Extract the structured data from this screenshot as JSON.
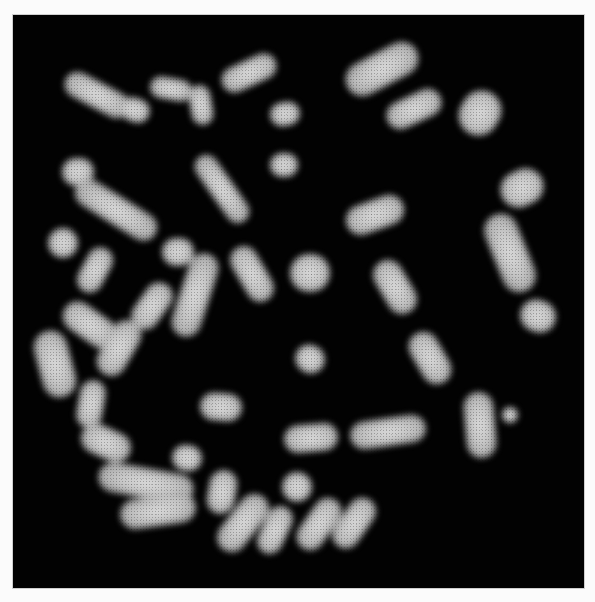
{
  "image": {
    "description": "Fluorescence micrograph of a metaphase chromosome spread on black background",
    "background_color": "#020202",
    "frame_color": "#fbfbfb",
    "chromosome_color": "#d6d6d6"
  },
  "chromosomes": [
    {
      "x": 62,
      "y": 82,
      "w": 70,
      "h": 26,
      "r": 28
    },
    {
      "x": 120,
      "y": 98,
      "w": 30,
      "h": 24,
      "r": 20
    },
    {
      "x": 150,
      "y": 78,
      "w": 42,
      "h": 22,
      "r": 10
    },
    {
      "x": 190,
      "y": 85,
      "w": 22,
      "h": 40,
      "r": -10
    },
    {
      "x": 220,
      "y": 60,
      "w": 58,
      "h": 26,
      "r": -25
    },
    {
      "x": 270,
      "y": 102,
      "w": 30,
      "h": 24,
      "r": -10
    },
    {
      "x": 62,
      "y": 158,
      "w": 32,
      "h": 28,
      "r": 0
    },
    {
      "x": 210,
      "y": 150,
      "w": 24,
      "h": 78,
      "r": -35
    },
    {
      "x": 270,
      "y": 153,
      "w": 28,
      "h": 24,
      "r": 0
    },
    {
      "x": 343,
      "y": 52,
      "w": 78,
      "h": 34,
      "r": -28
    },
    {
      "x": 385,
      "y": 95,
      "w": 58,
      "h": 28,
      "r": -25
    },
    {
      "x": 460,
      "y": 90,
      "w": 40,
      "h": 46,
      "r": 30
    },
    {
      "x": 500,
      "y": 170,
      "w": 44,
      "h": 36,
      "r": -25
    },
    {
      "x": 493,
      "y": 212,
      "w": 34,
      "h": 82,
      "r": -22
    },
    {
      "x": 520,
      "y": 300,
      "w": 36,
      "h": 32,
      "r": 20
    },
    {
      "x": 345,
      "y": 200,
      "w": 60,
      "h": 30,
      "r": -20
    },
    {
      "x": 380,
      "y": 258,
      "w": 30,
      "h": 58,
      "r": -30
    },
    {
      "x": 415,
      "y": 330,
      "w": 30,
      "h": 56,
      "r": -30
    },
    {
      "x": 295,
      "y": 345,
      "w": 30,
      "h": 28,
      "r": 35
    },
    {
      "x": 70,
      "y": 196,
      "w": 92,
      "h": 28,
      "r": 32
    },
    {
      "x": 48,
      "y": 228,
      "w": 30,
      "h": 30,
      "r": 0
    },
    {
      "x": 82,
      "y": 246,
      "w": 26,
      "h": 48,
      "r": 28
    },
    {
      "x": 162,
      "y": 238,
      "w": 32,
      "h": 28,
      "r": 0
    },
    {
      "x": 180,
      "y": 252,
      "w": 30,
      "h": 86,
      "r": 18
    },
    {
      "x": 238,
      "y": 244,
      "w": 28,
      "h": 60,
      "r": -30
    },
    {
      "x": 290,
      "y": 254,
      "w": 40,
      "h": 38,
      "r": 0
    },
    {
      "x": 138,
      "y": 280,
      "w": 28,
      "h": 52,
      "r": 35
    },
    {
      "x": 60,
      "y": 310,
      "w": 60,
      "h": 30,
      "r": 35
    },
    {
      "x": 38,
      "y": 330,
      "w": 34,
      "h": 68,
      "r": -15
    },
    {
      "x": 104,
      "y": 318,
      "w": 30,
      "h": 60,
      "r": 30
    },
    {
      "x": 78,
      "y": 380,
      "w": 26,
      "h": 48,
      "r": 10
    },
    {
      "x": 200,
      "y": 393,
      "w": 42,
      "h": 28,
      "r": 5
    },
    {
      "x": 80,
      "y": 428,
      "w": 52,
      "h": 30,
      "r": 25
    },
    {
      "x": 172,
      "y": 445,
      "w": 30,
      "h": 26,
      "r": 10
    },
    {
      "x": 98,
      "y": 468,
      "w": 96,
      "h": 30,
      "r": 10
    },
    {
      "x": 120,
      "y": 496,
      "w": 76,
      "h": 30,
      "r": -8
    },
    {
      "x": 208,
      "y": 470,
      "w": 28,
      "h": 44,
      "r": 10
    },
    {
      "x": 228,
      "y": 490,
      "w": 30,
      "h": 66,
      "r": 38
    },
    {
      "x": 282,
      "y": 472,
      "w": 30,
      "h": 30,
      "r": 0
    },
    {
      "x": 305,
      "y": 495,
      "w": 28,
      "h": 58,
      "r": 35
    },
    {
      "x": 340,
      "y": 495,
      "w": 28,
      "h": 56,
      "r": 35
    },
    {
      "x": 262,
      "y": 505,
      "w": 26,
      "h": 50,
      "r": 25
    },
    {
      "x": 284,
      "y": 424,
      "w": 54,
      "h": 28,
      "r": -5
    },
    {
      "x": 350,
      "y": 418,
      "w": 76,
      "h": 28,
      "r": -8
    },
    {
      "x": 465,
      "y": 392,
      "w": 30,
      "h": 66,
      "r": -5
    },
    {
      "x": 502,
      "y": 407,
      "w": 16,
      "h": 16,
      "r": 0
    }
  ]
}
